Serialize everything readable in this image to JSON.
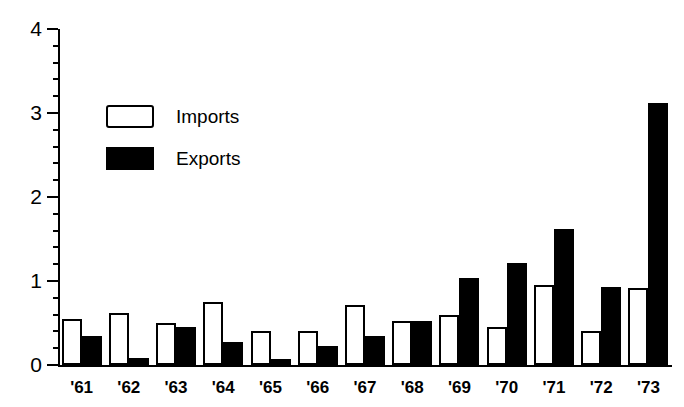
{
  "chart_data": {
    "type": "bar",
    "title": "",
    "subtitle": "",
    "xlabel": "",
    "ylabel": "",
    "ylim": [
      0,
      4
    ],
    "yticks": [
      0,
      1,
      2,
      3,
      4
    ],
    "ytick_labels": [
      "0",
      "1",
      "2",
      "3",
      "4"
    ],
    "minor_ticks": true,
    "minor_tick_step": 0.2,
    "grid": false,
    "legend_position": "upper-left",
    "categories": [
      "'61",
      "'62",
      "'63",
      "'64",
      "'65",
      "'66",
      "'67",
      "'68",
      "'69",
      "'70",
      "'71",
      "'72",
      "'73"
    ],
    "series": [
      {
        "name": "Imports",
        "color": "#ffffff",
        "edge_color": "#000000",
        "values": [
          0.55,
          0.62,
          0.5,
          0.75,
          0.4,
          0.4,
          0.72,
          0.52,
          0.6,
          0.45,
          0.95,
          0.4,
          0.92
        ]
      },
      {
        "name": "Exports",
        "color": "#000000",
        "edge_color": "#000000",
        "values": [
          0.35,
          0.08,
          0.45,
          0.27,
          0.07,
          0.23,
          0.35,
          0.52,
          1.03,
          1.22,
          1.62,
          0.93,
          3.12
        ]
      }
    ]
  },
  "legend": {
    "items": [
      {
        "label": "Imports",
        "swatch": "outlined-white-box"
      },
      {
        "label": "Exports",
        "swatch": "filled-black-box"
      }
    ]
  },
  "axes": {
    "y_axis_name": "value-axis",
    "x_axis_name": "year-axis"
  }
}
